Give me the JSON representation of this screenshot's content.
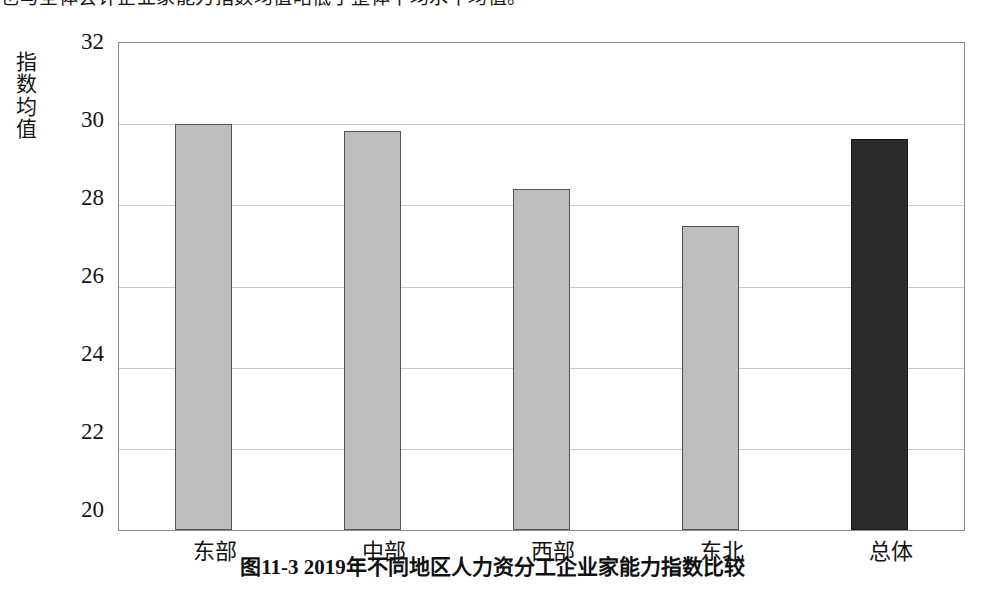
{
  "page": {
    "top_text_clipped": "也与全体会计企业家能力指数均值略低于整体平均水平均值。"
  },
  "caption": {
    "text": "图11-3  2019年不同地区人力资分工企业家能力指数比较"
  },
  "chart_data": {
    "type": "bar",
    "title": "",
    "xlabel": "",
    "ylabel": "指数均值",
    "categories": [
      "东部",
      "中部",
      "西部",
      "东北",
      "总体"
    ],
    "values": [
      30.0,
      29.82,
      28.4,
      27.5,
      29.64
    ],
    "series": [
      {
        "name": "指数均值",
        "values": [
          30.0,
          29.82,
          28.4,
          27.5,
          29.64
        ]
      }
    ],
    "ylim": [
      20,
      32
    ],
    "yticks": [
      32,
      30,
      28,
      26,
      24,
      22,
      20
    ],
    "ytick_labels": [
      "32",
      "30",
      "28",
      "26",
      "24",
      "22",
      "20"
    ],
    "grid": "horizontal",
    "legend": "none",
    "bar_colors": [
      "#bdbdbd",
      "#bdbdbd",
      "#bdbdbd",
      "#bdbdbd",
      "#2b2b2b"
    ],
    "highlight_category": "总体",
    "colors": {
      "bar_light": "#bdbdbd",
      "bar_dark": "#2b2b2b",
      "bar_outline": "#555555",
      "gridline": "#c9c9c9",
      "plot_border": "#8d8d8d",
      "text": "#141414"
    }
  }
}
